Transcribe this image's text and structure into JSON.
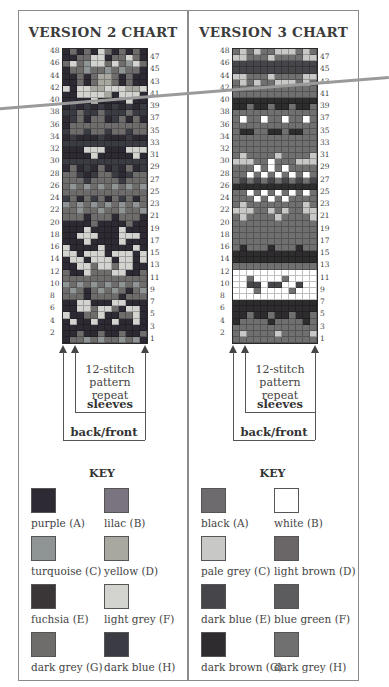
{
  "charts": [
    {
      "title": "VERSION 2 CHART",
      "rows_left": [
        "48",
        "46",
        "44",
        "42",
        "40",
        "38",
        "36",
        "34",
        "32",
        "30",
        "28",
        "26",
        "24",
        "22",
        "20",
        "18",
        "16",
        "14",
        "12",
        "10",
        "8",
        "6",
        "4",
        "2"
      ],
      "rows_right": [
        "47",
        "45",
        "43",
        "41",
        "39",
        "37",
        "35",
        "33",
        "31",
        "29",
        "27",
        "25",
        "23",
        "21",
        "19",
        "17",
        "15",
        "13",
        "11",
        "9",
        "7",
        "5",
        "3",
        "1"
      ],
      "repeat_note": [
        "12-stitch",
        "pattern",
        "repeat"
      ],
      "sleeves_label": "sleeves",
      "backfront_label": "back/front",
      "key_title": "KEY",
      "palette": {
        "A": "#2e2a33",
        "B": "#7a7480",
        "C": "#8f9495",
        "D": "#a8a8a0",
        "E": "#3a3638",
        "F": "#d3d3d0",
        "G": "#6f6d6c",
        "H": "#3b3b44"
      },
      "key": [
        {
          "label": "purple (A)",
          "color": "#2e2a33"
        },
        {
          "label": "lilac (B)",
          "color": "#7a7480"
        },
        {
          "label": "turquoise (C)",
          "color": "#8f9495"
        },
        {
          "label": "yellow (D)",
          "color": "#a8a8a0"
        },
        {
          "label": "fuchsia (E)",
          "color": "#3a3638"
        },
        {
          "label": "light grey (F)",
          "color": "#d3d3d0"
        },
        {
          "label": "dark grey (G)",
          "color": "#6f6d6c"
        },
        {
          "label": "dark blue (H)",
          "color": "#3b3b44"
        }
      ],
      "grid_rows_top_to_bottom": [
        "AGAGAFGAGAGA",
        "AAGGFFAGGFGA",
        "GFGCFFGFGCFG",
        "AGGCGGCGCGGA",
        "AAGAGDDGAGAA",
        "AAGAGDDGAGAA",
        "FAFFDDFFFDDF",
        "AAFFFFDAFFFA",
        "AAAAFAAAAFAA",
        "AHAHAHAHAHAH",
        "HHGHHGHHHGHH",
        "AHGAGGAHGAGA",
        "AGGGGGGGGGGG",
        "HGGHGGHGGHGG",
        "AHAAAHAAAHAA",
        "HHHHHHHHHHHH",
        "AAAFFFAAAFFF",
        "AAAAFAAAAAFA",
        "HHHHHHHHHHHH",
        "AGAHAGAHAGAH",
        "GGHAHGGHAHGG",
        "GGGHGGGGHGGG",
        "GCGCGCGCGCGC",
        "GGGGGGGGGGGG",
        "HGAGHGAGHGAG",
        "CGCGCGCGCGCG",
        "GGCGGCGGCGGC",
        "GGGAGGGAGGGA",
        "AAAAGAAAAGAA",
        "AAAFAAAAFAAA",
        "AAFFFAAAFFFA",
        "AAAFAAAAFAAA",
        "FAAAAFAAAAFA",
        "FFAFFFAFFFAF",
        "AFFAFFFAFFAF",
        "AAFFGFFGFFAA",
        "GAAFGGGFFAAG",
        "GGGGGGGGGGGG",
        "CGCGCGCGCGCG",
        "GCGAGCGCGAGC",
        "GGGAGGGGAGGG",
        "AAFFAAAFFAAA",
        "AAFFGFFGAFFA",
        "FAAGGFAAGGFA",
        "AFAAFAAFAAFA",
        "AAAAAAAAAAAA",
        "AAGAAGAAGAAG",
        "AGGCGCGGCGCA"
      ]
    },
    {
      "title": "VERSION 3 CHART",
      "rows_left": [
        "48",
        "46",
        "44",
        "42",
        "40",
        "38",
        "36",
        "34",
        "32",
        "30",
        "28",
        "26",
        "24",
        "22",
        "20",
        "18",
        "16",
        "14",
        "12",
        "10",
        "8",
        "6",
        "4",
        "2"
      ],
      "rows_right": [
        "47",
        "45",
        "43",
        "41",
        "39",
        "37",
        "35",
        "33",
        "31",
        "29",
        "27",
        "25",
        "23",
        "21",
        "19",
        "17",
        "15",
        "13",
        "11",
        "9",
        "7",
        "5",
        "3",
        "1"
      ],
      "repeat_note": [
        "12-stitch",
        "pattern",
        "repeat"
      ],
      "sleeves_label": "sleeves",
      "backfront_label": "back/front",
      "key_title": "KEY",
      "palette": {
        "A": "#6e6b6e",
        "B": "#ffffff",
        "C": "#c8c8c6",
        "D": "#6a6668",
        "E": "#464549",
        "F": "#5c5c5e",
        "G": "#2e2c2e",
        "H": "#707070"
      },
      "key": [
        {
          "label": "black (A)",
          "color": "#6e6b6e"
        },
        {
          "label": "white (B)",
          "color": "#ffffff"
        },
        {
          "label": "pale grey (C)",
          "color": "#c8c8c6"
        },
        {
          "label": "light brown (D)",
          "color": "#6a6668"
        },
        {
          "label": "dark blue (E)",
          "color": "#464549"
        },
        {
          "label": "blue green (F)",
          "color": "#5c5c5e"
        },
        {
          "label": "dark brown (G)",
          "color": "#2e2c2e"
        },
        {
          "label": "dark grey (H)",
          "color": "#707070"
        }
      ],
      "grid_rows_top_to_bottom": [
        "HCHCHHCCCHCH",
        "CCHHHCHHHHCC",
        "EEEEEEEEEEEE",
        "EEEEEEEEEEEE",
        "CCHHHCHHHHCC",
        "HCHCHHCCCHCH",
        "HHHHHHHHHHHH",
        "HHHHHHHHHHHH",
        "GGGGGGGGGGGG",
        "GGHGGHGGHGGH",
        "HHHHHHHHHHHH",
        "HBHHBHHBHHBH",
        "HHHHHHHHHHHH",
        "HGGHHGGHGGHH",
        "HHHHHHHHHHHH",
        "HHHHHHHHHHHH",
        "HHHHHHHHHHHH",
        "HCHHHHCHHHHC",
        "CCCHHBHHHCCC",
        "HHHBHBHBHHHH",
        "HHBHBHBHBHBH",
        "HEHEHEHEHEHE",
        "GGGGGGGGGGGG",
        "HHBHBHBHBHBH",
        "HHHBHBHBHHHH",
        "HCHHHHHHHHCH",
        "CCCHHCHCHHCC",
        "HCHHHHCHHHHC",
        "HHHHHHHHHHHH",
        "HHHHHHHHHHHH",
        "HHHHHHHHHHHH",
        "HHHHHHHHHHHH",
        "HGHHHGHHHGHH",
        "GGGGGGGGGGGG",
        "GGGGGGGGGGGG",
        "HHHHHHHHHHHH",
        "BBBBBBBBBBBB",
        "BBHBBBBHBBBB",
        "BBEEBEEBBEBB",
        "BBBHBBBBHBBB",
        "BBBBBBBBBBBB",
        "GGGGGGGGGGGG",
        "GGGGGGGGGGGG",
        "GGHGGHGGHGGH",
        "GHHHHGHHHHGH",
        "HHHHHHHHHHHH",
        "HCHHHHCHHHHC",
        "HHHHHHHHHHHH"
      ]
    }
  ]
}
